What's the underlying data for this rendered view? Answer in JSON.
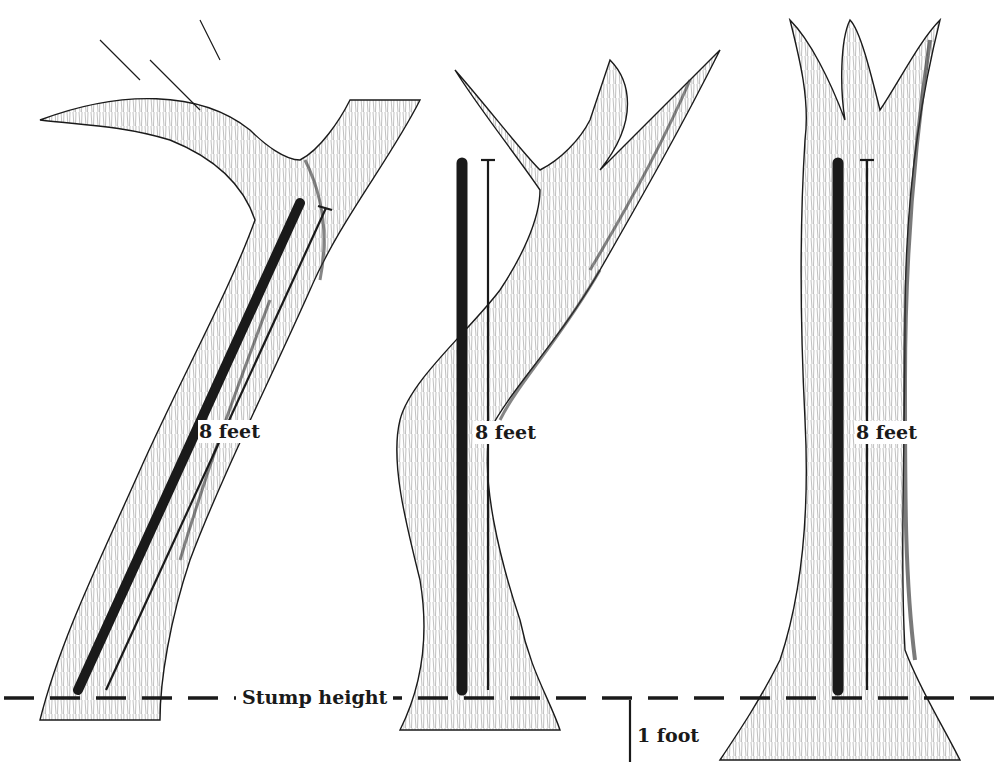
{
  "diagram": {
    "type": "illustration",
    "colors": {
      "ink": "#1a1a1a",
      "paper": "#ffffff",
      "bark_shade": "#555555"
    },
    "trees": [
      {
        "id": "leaning",
        "measure_label": "8 feet"
      },
      {
        "id": "crooked",
        "measure_label": "8 feet"
      },
      {
        "id": "straight",
        "measure_label": "8 feet"
      }
    ],
    "stump_line_label": "Stump height",
    "scale_label": "1 foot"
  }
}
